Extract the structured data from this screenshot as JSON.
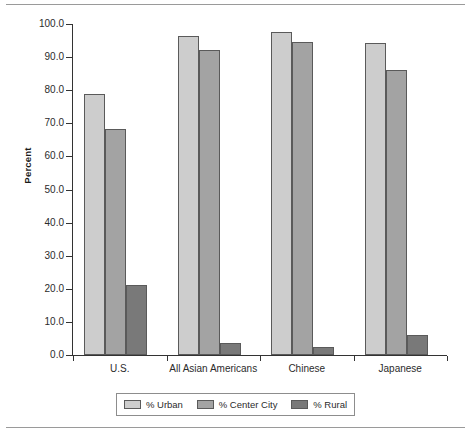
{
  "chart_data": {
    "type": "bar",
    "title": "",
    "subtitle": "",
    "xlabel": "",
    "ylabel": "Percent",
    "ylim": [
      0,
      100
    ],
    "ytick_labels": [
      "100.0",
      "90.0",
      "80.0",
      "70.0",
      "60.0",
      "50.0",
      "40.0",
      "30.0",
      "20.0",
      "10.0",
      "0.0"
    ],
    "ytick_values": [
      100,
      90,
      80,
      70,
      60,
      50,
      40,
      30,
      20,
      10,
      0
    ],
    "grid": false,
    "legend_position": "bottom",
    "categories": [
      "U.S.",
      "All Asian Americans",
      "Chinese",
      "Japanese"
    ],
    "series": [
      {
        "name": "% Urban",
        "color": "#cdcdcd",
        "values": [
          79.0,
          96.4,
          97.6,
          94.3
        ]
      },
      {
        "name": "% Center City",
        "color": "#a3a3a3",
        "values": [
          68.4,
          92.1,
          94.5,
          86.0
        ]
      },
      {
        "name": "% Rural",
        "color": "#797979",
        "values": [
          21.1,
          3.6,
          2.5,
          6.0
        ]
      }
    ]
  },
  "legend": {
    "items": [
      {
        "label": "% Urban",
        "swatch": "legend-swatch-urban"
      },
      {
        "label": "% Center City",
        "swatch": "legend-swatch-center-city"
      },
      {
        "label": "% Rural",
        "swatch": "legend-swatch-rural"
      }
    ]
  }
}
